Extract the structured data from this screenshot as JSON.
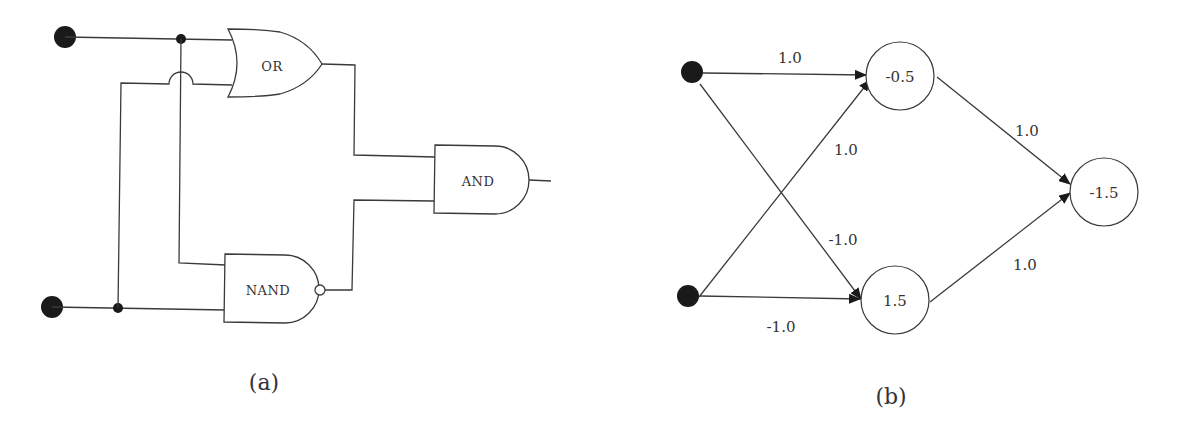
{
  "panel_a": {
    "caption": "(a)",
    "gates": {
      "or": "OR",
      "and": "AND",
      "nand": "NAND"
    }
  },
  "panel_b": {
    "caption": "(b)",
    "nodes": {
      "hidden_top": "-0.5",
      "hidden_bottom": "1.5",
      "output": "-1.5"
    },
    "weights": {
      "in1_to_top": "1.0",
      "in2_to_top": "1.0",
      "in1_to_bottom": "-1.0",
      "in2_to_bottom": "-1.0",
      "top_to_out": "1.0",
      "bottom_to_out": "1.0"
    }
  },
  "colors": {
    "stroke": "#3a3a3a",
    "fill_dot": "#1a1a1a",
    "background": "#ffffff"
  }
}
